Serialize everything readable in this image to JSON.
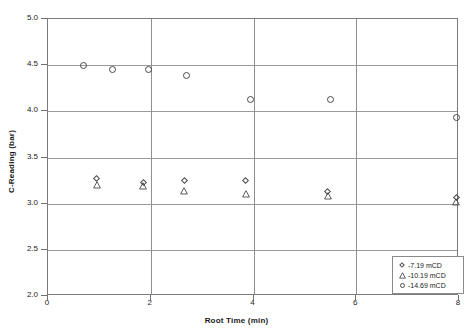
{
  "chart_data": {
    "type": "scatter",
    "title": "",
    "xlabel": "Root Time (min)",
    "ylabel": "C-Reading (bar)",
    "xlim": [
      0,
      8
    ],
    "ylim": [
      2.0,
      5.0
    ],
    "xticks": [
      "0",
      "2",
      "4",
      "6",
      "8"
    ],
    "xtick_values": [
      0,
      2,
      4,
      6,
      8
    ],
    "yticks": [
      "2.0",
      "2.5",
      "3.0",
      "3.5",
      "4.0",
      "4.5",
      "5.0"
    ],
    "ytick_values": [
      2.0,
      2.5,
      3.0,
      3.5,
      4.0,
      4.5,
      5.0
    ],
    "grid": true,
    "legend_position": "bottom-right",
    "series": [
      {
        "name": "-7.19 mCD",
        "marker": "diamond",
        "color": "#4a4a4a",
        "points": [
          {
            "x": 0.95,
            "y": 3.27
          },
          {
            "x": 1.85,
            "y": 3.23
          },
          {
            "x": 2.65,
            "y": 3.25
          },
          {
            "x": 3.85,
            "y": 3.25
          },
          {
            "x": 5.45,
            "y": 3.13
          },
          {
            "x": 7.95,
            "y": 3.07
          }
        ]
      },
      {
        "name": "-10.19 mCD",
        "marker": "triangle",
        "color": "#4a4a4a",
        "points": [
          {
            "x": 0.95,
            "y": 3.2
          },
          {
            "x": 1.85,
            "y": 3.19
          },
          {
            "x": 2.65,
            "y": 3.14
          },
          {
            "x": 3.85,
            "y": 3.11
          },
          {
            "x": 5.45,
            "y": 3.08
          },
          {
            "x": 7.95,
            "y": 3.02
          }
        ]
      },
      {
        "name": "-14.69 mCD",
        "marker": "circle",
        "color": "#4a4a4a",
        "points": [
          {
            "x": 0.7,
            "y": 4.5
          },
          {
            "x": 1.25,
            "y": 4.45
          },
          {
            "x": 1.95,
            "y": 4.45
          },
          {
            "x": 2.7,
            "y": 4.39
          },
          {
            "x": 3.95,
            "y": 4.13
          },
          {
            "x": 5.5,
            "y": 4.13
          },
          {
            "x": 7.95,
            "y": 3.93
          }
        ]
      }
    ],
    "legend": [
      {
        "label": "-7.19 mCD",
        "marker": "diamond"
      },
      {
        "label": "-10.19 mCD",
        "marker": "triangle"
      },
      {
        "label": "-14.69 mCD",
        "marker": "circle"
      }
    ]
  }
}
